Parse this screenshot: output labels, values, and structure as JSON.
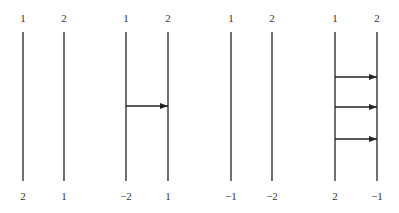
{
  "panels": [
    {
      "lines": [
        {
          "x": 23,
          "top": "1",
          "bottom": "2"
        },
        {
          "x": 64,
          "top": "2",
          "bottom": "1"
        }
      ],
      "arrows": []
    },
    {
      "lines": [
        {
          "x": 126,
          "top": "1",
          "bottom": "−2"
        },
        {
          "x": 168,
          "top": "2",
          "bottom": "1"
        }
      ],
      "arrows": [
        106
      ]
    },
    {
      "lines": [
        {
          "x": 231,
          "top": "1",
          "bottom": "−1"
        },
        {
          "x": 272,
          "top": "2",
          "bottom": "−2"
        }
      ],
      "arrows": []
    },
    {
      "lines": [
        {
          "x": 335,
          "top": "1",
          "bottom": "2"
        },
        {
          "x": 377,
          "top": "2",
          "bottom": "−1"
        }
      ],
      "arrows": [
        77,
        107,
        139
      ]
    }
  ],
  "style": {
    "line_color": "#222222",
    "text_color": "#333333"
  }
}
